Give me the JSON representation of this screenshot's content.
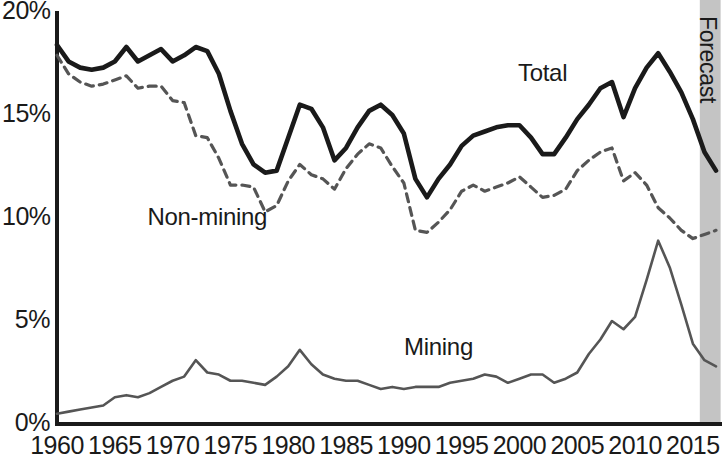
{
  "chart_data": {
    "type": "line",
    "title": "",
    "subtitle": "",
    "xlabel": "",
    "ylabel": "",
    "xlim": [
      1960,
      2017
    ],
    "ylim": [
      0,
      20
    ],
    "grid": false,
    "legend_position": "inline-annotations",
    "y_ticks": [
      "0%",
      "5%",
      "10%",
      "15%",
      "20%"
    ],
    "y_tick_values": [
      0,
      5,
      10,
      15,
      20
    ],
    "x_ticks": [
      "1960",
      "1965",
      "1970",
      "1975",
      "1980",
      "1985",
      "1990",
      "1995",
      "2000",
      "2005",
      "2010",
      "2015"
    ],
    "x_tick_values": [
      1960,
      1965,
      1970,
      1975,
      1980,
      1985,
      1990,
      1995,
      2000,
      2005,
      2010,
      2015
    ],
    "x": [
      1960,
      1961,
      1962,
      1963,
      1964,
      1965,
      1966,
      1967,
      1968,
      1969,
      1970,
      1971,
      1972,
      1973,
      1974,
      1975,
      1976,
      1977,
      1978,
      1979,
      1980,
      1981,
      1982,
      1983,
      1984,
      1985,
      1986,
      1987,
      1988,
      1989,
      1990,
      1991,
      1992,
      1993,
      1994,
      1995,
      1996,
      1997,
      1998,
      1999,
      2000,
      2001,
      2002,
      2003,
      2004,
      2005,
      2006,
      2007,
      2008,
      2009,
      2010,
      2011,
      2012,
      2013,
      2014,
      2015,
      2016,
      2017
    ],
    "series": [
      {
        "name": "Total",
        "style": "solid-thick",
        "color": "#1a1a1a",
        "values": [
          18.4,
          17.6,
          17.3,
          17.2,
          17.3,
          17.6,
          18.3,
          17.6,
          17.9,
          18.2,
          17.6,
          17.9,
          18.3,
          18.1,
          17.0,
          15.2,
          13.6,
          12.6,
          12.2,
          12.3,
          13.9,
          15.5,
          15.3,
          14.4,
          12.8,
          13.4,
          14.4,
          15.2,
          15.5,
          15.0,
          14.1,
          11.9,
          11.0,
          11.9,
          12.6,
          13.5,
          14.0,
          14.2,
          14.4,
          14.5,
          14.5,
          13.9,
          13.1,
          13.1,
          13.9,
          14.8,
          15.5,
          16.3,
          16.6,
          14.9,
          16.3,
          17.3,
          18.0,
          17.1,
          16.1,
          14.8,
          13.2,
          12.3
        ]
      },
      {
        "name": "Non-mining",
        "style": "dashed",
        "color": "#555555",
        "values": [
          17.9,
          17.0,
          16.6,
          16.4,
          16.5,
          16.7,
          16.9,
          16.3,
          16.4,
          16.4,
          15.7,
          15.6,
          14.0,
          13.9,
          12.9,
          11.6,
          11.6,
          11.5,
          10.3,
          10.6,
          11.8,
          12.6,
          12.1,
          11.9,
          11.4,
          12.4,
          13.1,
          13.6,
          13.4,
          12.5,
          11.7,
          9.4,
          9.3,
          9.8,
          10.4,
          11.3,
          11.6,
          11.3,
          11.5,
          11.7,
          12.0,
          11.5,
          11.0,
          11.1,
          11.4,
          12.3,
          12.8,
          13.2,
          13.4,
          11.8,
          12.2,
          11.6,
          10.5,
          10.0,
          9.4,
          9.0,
          9.2,
          9.4
        ]
      },
      {
        "name": "Mining",
        "style": "solid-thin",
        "color": "#555555",
        "values": [
          0.5,
          0.6,
          0.7,
          0.8,
          0.9,
          1.3,
          1.4,
          1.3,
          1.5,
          1.8,
          2.1,
          2.3,
          3.1,
          2.5,
          2.4,
          2.1,
          2.1,
          2.0,
          1.9,
          2.3,
          2.8,
          3.6,
          2.9,
          2.4,
          2.2,
          2.1,
          2.1,
          1.9,
          1.7,
          1.8,
          1.7,
          1.8,
          1.8,
          1.8,
          2.0,
          2.1,
          2.2,
          2.4,
          2.3,
          2.0,
          2.2,
          2.4,
          2.4,
          2.0,
          2.2,
          2.5,
          3.4,
          4.1,
          5.0,
          4.6,
          5.2,
          7.0,
          8.9,
          7.6,
          5.8,
          3.9,
          3.1,
          2.8
        ]
      }
    ],
    "annotations": [
      {
        "name": "Total",
        "text": "Total",
        "x_value": 2002,
        "y_value": 17.0
      },
      {
        "name": "Non-mining",
        "text": "Non-mining",
        "x_value": 1973,
        "y_value": 10.0
      },
      {
        "name": "Mining",
        "text": "Mining",
        "x_value": 1993,
        "y_value": 3.7
      }
    ],
    "shaded_regions": [
      {
        "name": "Forecast",
        "label": "Forecast",
        "x_start": 2015.6,
        "x_end": 2017.4,
        "color": "#c4c4c4"
      }
    ]
  }
}
